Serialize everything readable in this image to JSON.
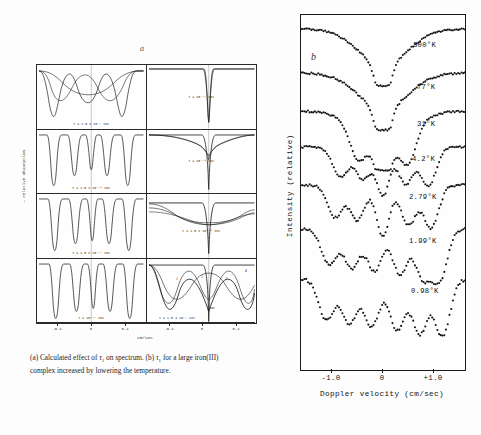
{
  "figure": {
    "panel_a": {
      "label": "a",
      "ylabel": "— relative absorption",
      "xlabel": "cm/sec",
      "xticks": [
        "-0.4",
        "0",
        "0.4",
        "-0.4",
        "0",
        "0.4"
      ],
      "subpanels": [
        {
          "row": 1,
          "col": 1,
          "tau": "τ = 1.5 x 10⁻⁹ sec"
        },
        {
          "row": 1,
          "col": 2,
          "tau": "τ = 10⁻¹¹ sec"
        },
        {
          "row": 2,
          "col": 1,
          "tau": "τ = 1.5 x 10⁻¹⁰ sec"
        },
        {
          "row": 2,
          "col": 2,
          "tau": "τ = 10⁻¹⁰ sec"
        },
        {
          "row": 3,
          "col": 1,
          "tau": "τ = 1.5 x 10⁻¹¹ sec"
        },
        {
          "row": 3,
          "col": 2,
          "tau": "τ = 1.5 x 10⁻¹⁰ sec"
        },
        {
          "row": 4,
          "col": 1,
          "tau": "τ = 10⁻¹² sec"
        },
        {
          "row": 4,
          "col": 2,
          "tau": "τ = 1.5 x 10⁻⁹ sec"
        }
      ],
      "peak_labels": [
        "1",
        "2",
        "3",
        "4",
        "sum"
      ]
    },
    "panel_b": {
      "label": "b",
      "ylabel": "Intensity  (relative)",
      "xlabel": "Doppler  velocity   (cm/sec)",
      "xticks": [
        "-1.0",
        "0",
        "+1.0"
      ],
      "xlim": [
        -1.45,
        1.45
      ],
      "traces": [
        {
          "temperature": "300°K"
        },
        {
          "temperature": "77°K"
        },
        {
          "temperature": "31°K"
        },
        {
          "temperature": "4.2°K"
        },
        {
          "temperature": "2.79°K"
        },
        {
          "temperature": "1.99°K"
        },
        {
          "temperature": "0.98°K"
        }
      ]
    },
    "caption": {
      "line1_a": "(a) Calculated effect of ",
      "line1_tau": "τ",
      "line1_sub": "1",
      "line1_b": " on spectrum. (b) ",
      "line1_tau2": "τ",
      "line1_sub2": "1",
      "line1_c": " for a large",
      "line2": "iron(III) complex increased by lowering the temperature."
    }
  },
  "chart_data": [
    {
      "type": "line",
      "title": "(a) Calculated Mossbauer spectra vs spin relaxation time",
      "xlabel": "cm/sec",
      "ylabel": "— relative absorption",
      "xlim": [
        -0.6,
        0.6
      ],
      "grid": false,
      "legend": "none",
      "panels": [
        {
          "tau": "1.5 x 10^-9 s",
          "peaks_cm_per_sec": [
            -0.42,
            -0.2,
            0.0,
            0.2,
            0.42
          ],
          "description": "broad overlapping six-line pattern, three component envelopes"
        },
        {
          "tau": "10^-11 s",
          "peaks_cm_per_sec": [
            0.0
          ],
          "description": "single sharp collapsed line at zero velocity"
        },
        {
          "tau": "1.5 x 10^-10 s",
          "peaks_cm_per_sec": [
            -0.42,
            -0.22,
            -0.05,
            0.08,
            0.24,
            0.44
          ],
          "description": "resolved sharp hyperfine sextet"
        },
        {
          "tau": "10^-10 s",
          "peaks_cm_per_sec": [
            0.0
          ],
          "description": "sharp central line with broad wings"
        },
        {
          "tau": "1.5 x 10^-11 s",
          "peaks_cm_per_sec": [
            -0.4,
            -0.18,
            0.02,
            0.22,
            0.42
          ],
          "description": "sharp lines, slightly broadened"
        },
        {
          "tau": "1.5 x 10^-10 s",
          "peaks_cm_per_sec": [
            0.0
          ],
          "description": "sharp central line on broad shallow background"
        },
        {
          "tau": "10^-12 s",
          "peaks_cm_per_sec": [
            -0.4,
            -0.17,
            0.03,
            0.23,
            0.43
          ],
          "description": "narrow well resolved lines"
        },
        {
          "tau": "1.5 x 10^-9 s",
          "peaks_cm_per_sec": [
            -0.35,
            -0.12,
            0.0,
            0.16,
            0.38
          ],
          "description": "sum curve with labelled components 1,2,3,4 and sum"
        }
      ]
    },
    {
      "type": "scatter",
      "title": "(b) Experimental Mossbauer spectra of a large iron(III) complex",
      "xlabel": "Doppler  velocity   (cm/sec)",
      "ylabel": "Intensity  (relative)",
      "xlim": [
        -1.45,
        1.45
      ],
      "xticks": [
        -1.0,
        0,
        1.0
      ],
      "grid": false,
      "legend": "inline-right",
      "series": [
        {
          "name": "300°K",
          "minima_cm_per_sec": [
            0.0
          ],
          "description": "single broad deep V centred at 0"
        },
        {
          "name": "77°K",
          "minima_cm_per_sec": [
            0.0
          ],
          "description": "broad V with weak shoulders near -0.5"
        },
        {
          "name": "31°K",
          "minima_cm_per_sec": [
            -0.45,
            0.0,
            0.45
          ],
          "description": "central dip plus emerging side dips"
        },
        {
          "name": "4.2°K",
          "minima_cm_per_sec": [
            -0.75,
            -0.35,
            0.0,
            0.4,
            0.8
          ],
          "description": "partly resolved hyperfine structure"
        },
        {
          "name": "2.79°K",
          "minima_cm_per_sec": [
            -0.85,
            -0.45,
            0.0,
            0.45,
            0.85
          ],
          "description": "better resolved multiplet"
        },
        {
          "name": "1.99°K",
          "minima_cm_per_sec": [
            -0.95,
            -0.55,
            -0.15,
            0.3,
            0.7,
            1.0
          ],
          "description": "well resolved six line pattern"
        },
        {
          "name": "0.98°K",
          "minima_cm_per_sec": [
            -1.0,
            -0.6,
            -0.2,
            0.25,
            0.65,
            1.05
          ],
          "description": "fully resolved magnetic hyperfine sextet"
        }
      ]
    }
  ]
}
